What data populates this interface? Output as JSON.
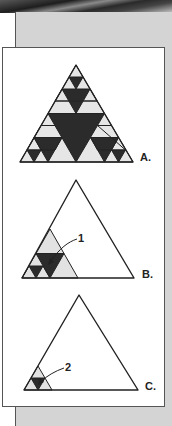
{
  "figure": {
    "panels": [
      {
        "id": "A",
        "label": "A.",
        "description": "Sierpinski triangle, level 3"
      },
      {
        "id": "B",
        "label": "B.",
        "callout": "1",
        "description": "Outline triangle with a shaded lower-left sub-triangle"
      },
      {
        "id": "C",
        "label": "C.",
        "callout": "2",
        "description": "Outline triangle with a smaller shaded lower-left sub-triangle"
      }
    ],
    "colors": {
      "dark_fill": "#2b2b2b",
      "light_fill": "#dcdcdc",
      "outline": "#222222",
      "panel_background": "#d4d4d4"
    }
  }
}
